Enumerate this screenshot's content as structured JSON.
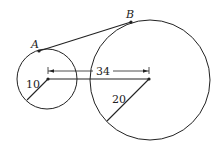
{
  "diagram": {
    "type": "two-circles-external-tangent",
    "points": {
      "A": {
        "label": "A"
      },
      "B": {
        "label": "B"
      }
    },
    "small_circle": {
      "radius_label": "10"
    },
    "large_circle": {
      "radius_label": "20"
    },
    "center_distance_label": "34",
    "colors": {
      "stroke": "#222222",
      "background": "#ffffff"
    }
  }
}
